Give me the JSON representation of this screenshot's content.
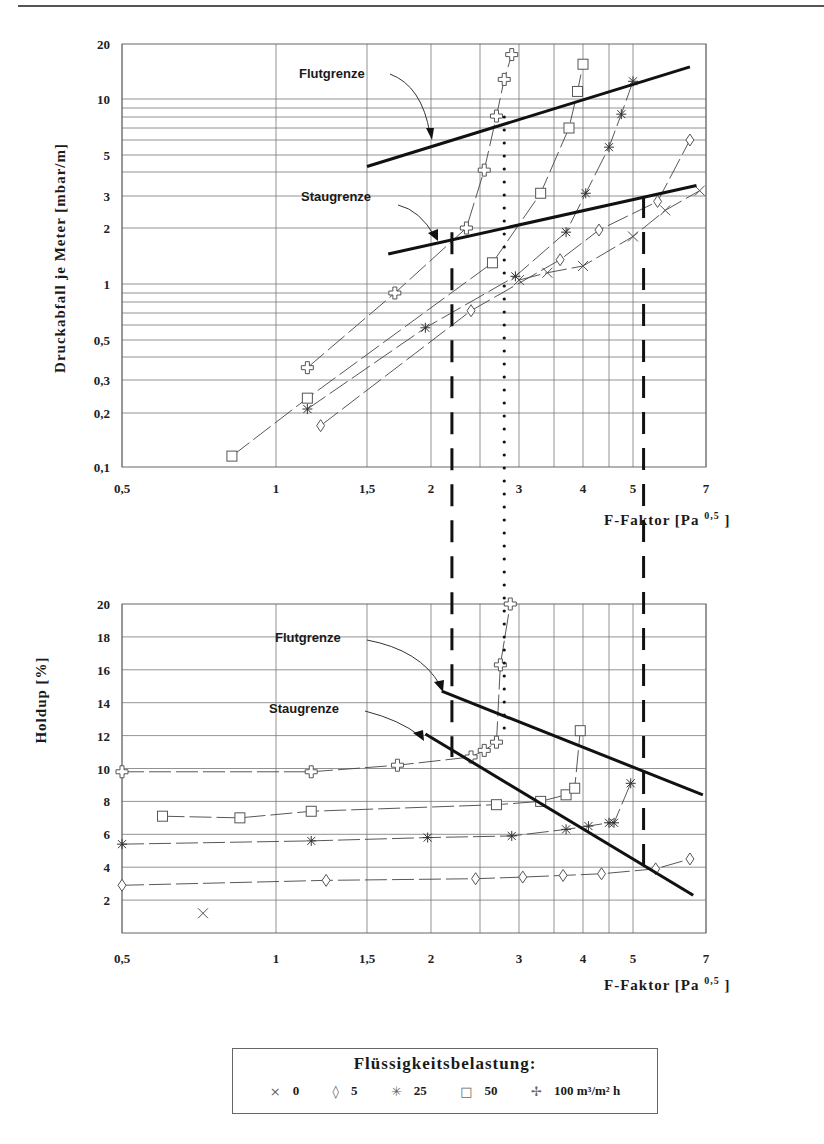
{
  "page": {
    "header_rule": true
  },
  "chart_data": [
    {
      "id": "pressure-drop",
      "type": "scatter",
      "title": "",
      "xlabel": "F-Faktor [Pa^0,5]",
      "xlabel_main": "F-Faktor [Pa",
      "xlabel_sup": "0,5",
      "xlabel_tail": "]",
      "ylabel": "Druckabfall je Meter [mbar/m]",
      "xscale": "log",
      "yscale": "log",
      "xlim": [
        0.5,
        7
      ],
      "ylim": [
        0.1,
        20
      ],
      "x_ticks": [
        "0,5",
        "1",
        "1,5",
        "2",
        "3",
        "4",
        "5",
        "7"
      ],
      "y_ticks": [
        "0,1",
        "0,2",
        "0,3",
        "0,5",
        "1",
        "2",
        "3",
        "5",
        "10",
        "20"
      ],
      "grid": true,
      "annotations": [
        {
          "text": "Flutgrenze",
          "x": 2.1,
          "y": 7.2
        },
        {
          "text": "Staugrenze",
          "x": 2.15,
          "y": 1.75
        }
      ],
      "boundary_lines": [
        {
          "name": "Flutgrenze",
          "points": [
            [
              1.5,
              4.3
            ],
            [
              6.5,
              15
            ]
          ]
        },
        {
          "name": "Staugrenze",
          "points": [
            [
              1.65,
              1.45
            ],
            [
              6.7,
              3.4
            ]
          ]
        }
      ],
      "series": [
        {
          "name": "0",
          "marker": "x",
          "points": [
            [
              3.0,
              1.05
            ],
            [
              3.4,
              1.15
            ],
            [
              4.0,
              1.25
            ],
            [
              5.0,
              1.8
            ],
            [
              5.8,
              2.5
            ],
            [
              6.8,
              3.2
            ]
          ]
        },
        {
          "name": "5",
          "marker": "diamond",
          "points": [
            [
              1.22,
              0.17
            ],
            [
              2.4,
              0.72
            ],
            [
              3.6,
              1.35
            ],
            [
              4.3,
              1.95
            ],
            [
              5.6,
              2.8
            ],
            [
              6.5,
              6.0
            ]
          ]
        },
        {
          "name": "25",
          "marker": "asterisk",
          "points": [
            [
              1.15,
              0.21
            ],
            [
              1.95,
              0.58
            ],
            [
              2.95,
              1.1
            ],
            [
              3.7,
              1.9
            ],
            [
              4.05,
              3.1
            ],
            [
              4.5,
              5.5
            ],
            [
              4.75,
              8.3
            ],
            [
              5.0,
              12.5
            ]
          ]
        },
        {
          "name": "50",
          "marker": "square",
          "points": [
            [
              0.82,
              0.115
            ],
            [
              1.15,
              0.24
            ],
            [
              2.65,
              1.3
            ],
            [
              3.3,
              3.1
            ],
            [
              3.75,
              7.0
            ],
            [
              3.9,
              11.0
            ],
            [
              4.0,
              15.5
            ]
          ]
        },
        {
          "name": "100",
          "marker": "plus",
          "points": [
            [
              1.15,
              0.35
            ],
            [
              1.7,
              0.9
            ],
            [
              2.35,
              2.0
            ],
            [
              2.55,
              4.1
            ],
            [
              2.7,
              8.1
            ],
            [
              2.8,
              12.8
            ],
            [
              2.9,
              17.5
            ]
          ]
        }
      ],
      "reference_lines": [
        {
          "style": "dashed",
          "x": 2.2
        },
        {
          "style": "dotted",
          "x": 2.8
        },
        {
          "style": "dashed",
          "x": 5.25
        }
      ]
    },
    {
      "id": "holdup",
      "type": "scatter",
      "xlabel": "F-Faktor [Pa^0,5]",
      "xlabel_main": "F-Faktor [Pa",
      "xlabel_sup": "0,5",
      "xlabel_tail": "]",
      "ylabel": "Holdup [%]",
      "xscale": "log",
      "yscale": "linear",
      "xlim": [
        0.5,
        7
      ],
      "ylim": [
        0,
        20
      ],
      "x_ticks": [
        "0,5",
        "1",
        "1,5",
        "2",
        "3",
        "4",
        "5",
        "7"
      ],
      "y_ticks": [
        "2",
        "4",
        "6",
        "8",
        "10",
        "12",
        "14",
        "16",
        "18",
        "20"
      ],
      "grid": true,
      "annotations": [
        {
          "text": "Flutgrenze",
          "x": 1.5,
          "y": 18
        },
        {
          "text": "Staugrenze",
          "x": 1.45,
          "y": 14
        }
      ],
      "boundary_lines": [
        {
          "name": "Flutgrenze",
          "points": [
            [
              2.1,
              14.7
            ],
            [
              6.9,
              8.4
            ]
          ]
        },
        {
          "name": "Staugrenze",
          "points": [
            [
              1.95,
              12.1
            ],
            [
              6.6,
              2.3
            ]
          ]
        }
      ],
      "series": [
        {
          "name": "0",
          "marker": "x",
          "points": [
            [
              0.72,
              1.2
            ]
          ]
        },
        {
          "name": "5",
          "marker": "diamond",
          "points": [
            [
              0.5,
              2.9
            ],
            [
              1.25,
              3.2
            ],
            [
              2.45,
              3.3
            ],
            [
              3.05,
              3.4
            ],
            [
              3.65,
              3.5
            ],
            [
              4.35,
              3.6
            ],
            [
              5.55,
              3.9
            ],
            [
              6.5,
              4.5
            ]
          ]
        },
        {
          "name": "25",
          "marker": "asterisk",
          "points": [
            [
              0.5,
              5.4
            ],
            [
              1.17,
              5.6
            ],
            [
              1.97,
              5.8
            ],
            [
              2.9,
              5.9
            ],
            [
              3.7,
              6.3
            ],
            [
              4.1,
              6.5
            ],
            [
              4.5,
              6.7
            ],
            [
              4.6,
              6.7
            ],
            [
              4.95,
              9.1
            ]
          ]
        },
        {
          "name": "50",
          "marker": "square",
          "points": [
            [
              0.6,
              7.1
            ],
            [
              0.85,
              7.0
            ],
            [
              1.17,
              7.4
            ],
            [
              2.7,
              7.8
            ],
            [
              3.3,
              8.0
            ],
            [
              3.7,
              8.4
            ],
            [
              3.85,
              8.8
            ],
            [
              3.95,
              12.3
            ]
          ]
        },
        {
          "name": "100",
          "marker": "plus",
          "points": [
            [
              0.5,
              9.8
            ],
            [
              1.17,
              9.8
            ],
            [
              1.72,
              10.2
            ],
            [
              2.4,
              10.7
            ],
            [
              2.55,
              11.1
            ],
            [
              2.7,
              11.6
            ],
            [
              2.75,
              16.3
            ],
            [
              2.88,
              20.0
            ]
          ]
        }
      ],
      "reference_lines": [
        {
          "style": "dashed",
          "x": 2.2
        },
        {
          "style": "dotted",
          "x": 2.8
        },
        {
          "style": "dashed",
          "x": 5.25
        }
      ]
    }
  ],
  "legend": {
    "title": "Flüssigkeitsbelastung:",
    "items": [
      {
        "symbol": "×",
        "label": "0"
      },
      {
        "symbol": "◊",
        "label": "5"
      },
      {
        "symbol": "✳",
        "label": "25"
      },
      {
        "symbol": "□",
        "label": "50"
      },
      {
        "symbol": "✢",
        "label": "100 m³/m² h"
      }
    ]
  }
}
